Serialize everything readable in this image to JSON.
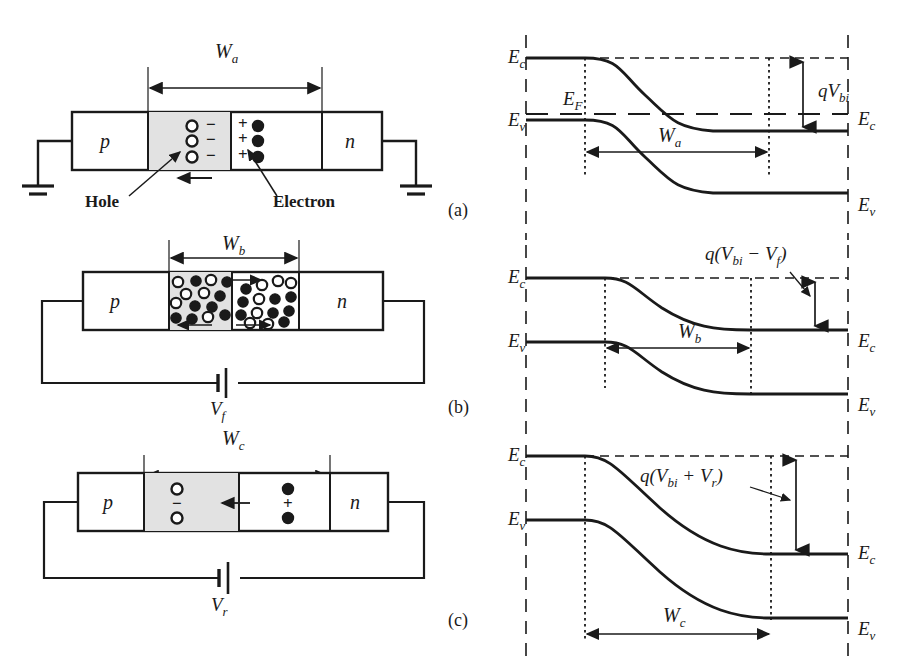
{
  "figure": {
    "panels": [
      "(a)",
      "(b)",
      "(c)"
    ]
  },
  "panel_labels": {
    "a": "(a)",
    "b": "(b)",
    "c": "(c)"
  },
  "devices": {
    "a": {
      "region_p": "p",
      "region_n": "n",
      "width_label": "W",
      "width_sub": "a",
      "annotation_hole": "Hole",
      "annotation_electron": "Electron",
      "depletion_p_charges": [
        "−",
        "−",
        "−"
      ],
      "depletion_n_charges": [
        "+",
        "+",
        "+"
      ],
      "bias": "none",
      "terminal_left": "ground",
      "terminal_right": "ground"
    },
    "b": {
      "region_p": "p",
      "region_n": "n",
      "width_label": "W",
      "width_sub": "b",
      "bias": "forward",
      "source_label": "V",
      "source_sub": "f"
    },
    "c": {
      "region_p": "p",
      "region_n": "n",
      "width_label": "W",
      "width_sub": "c",
      "bias": "reverse",
      "source_label": "V",
      "source_sub": "r",
      "depletion_p_charges": [
        "−"
      ],
      "depletion_n_charges": [
        "+"
      ]
    }
  },
  "bands": {
    "a": {
      "Ec_left": "E",
      "Ec_left_sub": "c",
      "Ev_left": "E",
      "Ev_left_sub": "v",
      "Ef": "E",
      "Ef_sub": "F",
      "Ec_right": "E",
      "Ec_right_sub": "c",
      "Ev_right": "E",
      "Ev_right_sub": "v",
      "barrier": "qV",
      "barrier_sub": "bi",
      "width_label": "W",
      "width_sub": "a"
    },
    "b": {
      "Ec_left": "E",
      "Ec_left_sub": "c",
      "Ev_left": "E",
      "Ev_left_sub": "v",
      "Ec_right": "E",
      "Ec_right_sub": "c",
      "Ev_right": "E",
      "Ev_right_sub": "v",
      "barrier": "q(V",
      "barrier_sub1": "bi",
      "barrier_mid": " − V",
      "barrier_sub2": "f",
      "barrier_end": ")",
      "width_label": "W",
      "width_sub": "b"
    },
    "c": {
      "Ec_left": "E",
      "Ec_left_sub": "c",
      "Ev_left": "E",
      "Ev_left_sub": "v",
      "Ec_right": "E",
      "Ec_right_sub": "c",
      "Ev_right": "E",
      "Ev_right_sub": "v",
      "barrier": "q(V",
      "barrier_sub1": "bi",
      "barrier_mid": " + V",
      "barrier_sub2": "r",
      "barrier_end": ")",
      "width_label": "W",
      "width_sub": "c"
    }
  },
  "colors": {
    "line": "#1a1a1a",
    "depletion_fill": "#e2e2e2",
    "background": "#ffffff",
    "electron_fill": "#1a1a1a",
    "hole_fill": "#ffffff"
  }
}
